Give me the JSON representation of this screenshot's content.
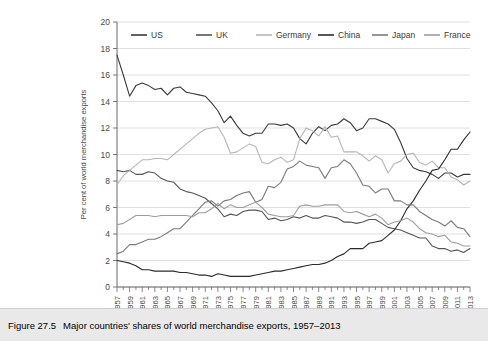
{
  "caption": {
    "label": "Figure 27.5",
    "text": "Major countries' shares of world merchandise exports, 1957–2013"
  },
  "chart_data": {
    "type": "line",
    "title": "Major countries' shares of world merchandise exports, 1957–2013",
    "xlabel": "",
    "ylabel": "Per cent of world merchandise exports",
    "ylim": [
      0,
      20
    ],
    "ytick_step": 2,
    "yticks": [
      0,
      2,
      4,
      6,
      8,
      10,
      12,
      14,
      16,
      18,
      20
    ],
    "xlim": [
      1957,
      2013
    ],
    "xticks": [
      1957,
      1959,
      1961,
      1963,
      1965,
      1967,
      1969,
      1971,
      1973,
      1975,
      1977,
      1979,
      1981,
      1983,
      1985,
      1987,
      1989,
      1991,
      1993,
      1995,
      1997,
      1999,
      2001,
      2003,
      2005,
      2007,
      2009,
      2011,
      2013
    ],
    "grid": "horizontal",
    "legend_position": "top",
    "x": [
      1957,
      1958,
      1959,
      1960,
      1961,
      1962,
      1963,
      1964,
      1965,
      1966,
      1967,
      1968,
      1969,
      1970,
      1971,
      1972,
      1973,
      1974,
      1975,
      1976,
      1977,
      1978,
      1979,
      1980,
      1981,
      1982,
      1983,
      1984,
      1985,
      1986,
      1987,
      1988,
      1989,
      1990,
      1991,
      1992,
      1993,
      1994,
      1995,
      1996,
      1997,
      1998,
      1999,
      2000,
      2001,
      2002,
      2003,
      2004,
      2005,
      2006,
      2007,
      2008,
      2009,
      2010,
      2011,
      2012,
      2013
    ],
    "series": [
      {
        "name": "US",
        "color": "#3a3a3a",
        "values": [
          17.5,
          16.0,
          14.4,
          15.2,
          15.4,
          15.2,
          14.9,
          15.0,
          14.5,
          15.0,
          15.1,
          14.7,
          14.6,
          14.5,
          14.4,
          13.9,
          13.3,
          12.4,
          12.9,
          12.2,
          11.6,
          11.4,
          11.6,
          11.6,
          12.3,
          12.3,
          12.2,
          12.3,
          12.0,
          11.2,
          10.8,
          11.6,
          12.1,
          11.8,
          12.2,
          12.3,
          12.7,
          12.4,
          11.8,
          12.0,
          12.7,
          12.7,
          12.5,
          12.3,
          11.9,
          10.9,
          9.7,
          9.0,
          8.8,
          8.7,
          8.5,
          8.2,
          8.6,
          8.6,
          8.3,
          8.5,
          8.5
        ]
      },
      {
        "name": "UK",
        "color": "#555555",
        "values": [
          8.8,
          8.7,
          8.8,
          8.5,
          8.5,
          8.7,
          8.6,
          8.2,
          8.0,
          7.9,
          7.4,
          7.2,
          7.1,
          6.9,
          6.7,
          6.3,
          5.9,
          5.3,
          5.5,
          5.4,
          5.7,
          5.8,
          5.8,
          5.7,
          5.1,
          5.2,
          5.0,
          5.1,
          5.3,
          5.2,
          5.4,
          5.2,
          5.2,
          5.4,
          5.3,
          5.2,
          4.9,
          4.9,
          4.8,
          4.9,
          5.1,
          5.1,
          4.8,
          4.5,
          4.4,
          4.3,
          4.1,
          3.9,
          3.7,
          3.7,
          3.1,
          2.9,
          2.9,
          2.7,
          2.8,
          2.6,
          2.9
        ]
      },
      {
        "name": "Germany",
        "color": "#b5b5b5",
        "values": [
          7.7,
          8.4,
          8.8,
          9.2,
          9.6,
          9.6,
          9.7,
          9.7,
          9.6,
          10.0,
          10.4,
          10.8,
          11.2,
          11.6,
          11.9,
          12.0,
          12.1,
          11.3,
          10.1,
          10.2,
          10.5,
          10.8,
          10.6,
          9.4,
          9.3,
          9.6,
          9.8,
          9.4,
          9.6,
          11.2,
          12.0,
          11.8,
          11.4,
          12.1,
          11.3,
          11.4,
          10.2,
          10.2,
          10.2,
          9.9,
          9.5,
          9.9,
          9.6,
          8.6,
          9.3,
          9.5,
          10.0,
          10.1,
          9.4,
          9.2,
          9.5,
          9.0,
          9.0,
          8.3,
          8.1,
          7.7,
          8.0
        ]
      },
      {
        "name": "China",
        "color": "#2b2b2b",
        "values": [
          2.0,
          1.9,
          1.8,
          1.6,
          1.3,
          1.3,
          1.2,
          1.2,
          1.2,
          1.2,
          1.1,
          1.1,
          1.0,
          0.9,
          0.9,
          0.8,
          1.0,
          0.9,
          0.8,
          0.8,
          0.8,
          0.8,
          0.9,
          1.0,
          1.1,
          1.2,
          1.2,
          1.3,
          1.4,
          1.5,
          1.6,
          1.7,
          1.7,
          1.8,
          2.0,
          2.3,
          2.5,
          2.9,
          2.9,
          2.9,
          3.3,
          3.4,
          3.5,
          3.9,
          4.3,
          5.0,
          5.9,
          6.5,
          7.3,
          8.0,
          8.8,
          8.9,
          9.6,
          10.4,
          10.4,
          11.1,
          11.7
        ]
      },
      {
        "name": "Japan",
        "color": "#7a7a7a",
        "values": [
          2.5,
          2.7,
          3.2,
          3.2,
          3.4,
          3.6,
          3.6,
          3.8,
          4.1,
          4.4,
          4.4,
          4.9,
          5.4,
          5.9,
          6.4,
          6.5,
          6.1,
          6.5,
          6.6,
          6.9,
          7.1,
          7.2,
          6.4,
          6.6,
          7.6,
          7.5,
          7.9,
          8.9,
          9.1,
          9.5,
          9.2,
          9.1,
          9.0,
          8.2,
          9.0,
          9.1,
          9.6,
          9.3,
          8.6,
          7.7,
          7.6,
          7.1,
          7.4,
          7.4,
          6.5,
          6.5,
          6.2,
          6.2,
          5.7,
          5.4,
          5.1,
          4.9,
          4.6,
          5.0,
          4.5,
          4.4,
          3.8
        ]
      },
      {
        "name": "France",
        "color": "#9d9d9d",
        "values": [
          4.7,
          4.8,
          5.1,
          5.4,
          5.4,
          5.4,
          5.3,
          5.4,
          5.4,
          5.4,
          5.4,
          5.4,
          5.3,
          5.6,
          5.6,
          5.9,
          6.3,
          5.9,
          6.2,
          6.0,
          6.0,
          6.2,
          6.4,
          6.0,
          5.5,
          5.4,
          5.3,
          5.3,
          5.4,
          6.1,
          6.2,
          6.1,
          6.1,
          6.2,
          6.2,
          6.2,
          5.7,
          5.6,
          5.7,
          5.5,
          5.3,
          5.5,
          5.2,
          4.7,
          4.9,
          5.0,
          5.2,
          4.9,
          4.4,
          4.1,
          4.0,
          3.8,
          3.9,
          3.4,
          3.3,
          3.1,
          3.1
        ]
      }
    ],
    "legend": [
      {
        "label": "US",
        "color": "#3a3a3a"
      },
      {
        "label": "UK",
        "color": "#555555"
      },
      {
        "label": "Germany",
        "color": "#b5b5b5"
      },
      {
        "label": "China",
        "color": "#2b2b2b"
      },
      {
        "label": "Japan",
        "color": "#7a7a7a"
      },
      {
        "label": "France",
        "color": "#9d9d9d"
      }
    ]
  }
}
